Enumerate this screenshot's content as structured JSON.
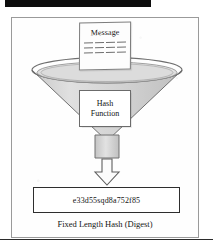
{
  "diagram": {
    "input_document": {
      "label": "Message",
      "line_rows": 3,
      "dashes_per_row": 4
    },
    "processor": {
      "label_line1": "Hash",
      "label_line2": "Function",
      "shape": "funnel"
    },
    "flow_arrow": {
      "direction": "down",
      "icon": "down-arrow-icon"
    },
    "output": {
      "hash_value": "e33d55sqd8a752f85",
      "caption": "Fixed Length Hash (Digest)"
    },
    "colors": {
      "funnel_fill": "#d8d8d8",
      "funnel_stroke": "#6f6f6f",
      "frame_stroke": "#9a9a9a",
      "result_box_stroke": "#2e2e2e",
      "text": "#141414",
      "scan_bar": "#0d0d0d"
    }
  }
}
